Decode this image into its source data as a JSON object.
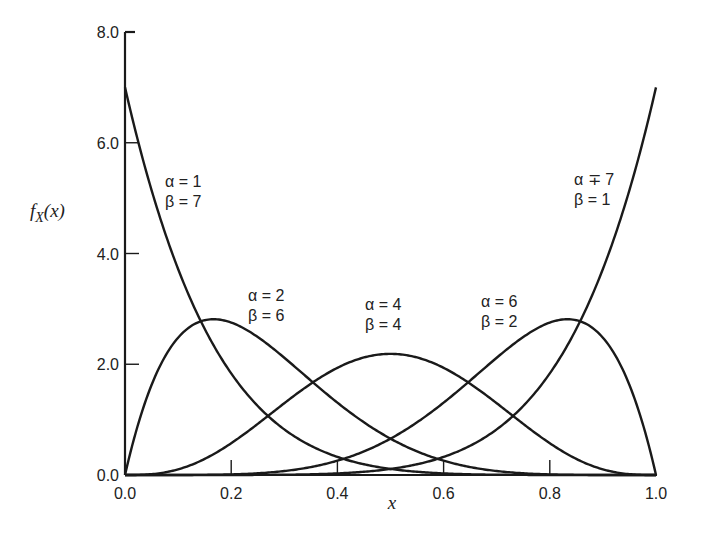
{
  "chart_data": {
    "type": "line",
    "title": "",
    "xlabel": "x",
    "ylabel": "f_X(x)",
    "ylabel_display": {
      "main": "f",
      "sub": "X",
      "arg": "(x)"
    },
    "xlim": [
      0.0,
      1.0
    ],
    "ylim": [
      0.0,
      8.0
    ],
    "x_ticks": [
      "0.0",
      "0.2",
      "0.4",
      "0.6",
      "0.8",
      "1.0"
    ],
    "x_tick_values": [
      0.0,
      0.2,
      0.4,
      0.6,
      0.8,
      1.0
    ],
    "y_ticks": [
      "0.0",
      "2.0",
      "4.0",
      "6.0",
      "8.0"
    ],
    "y_tick_values": [
      0.0,
      2.0,
      4.0,
      6.0,
      8.0
    ],
    "grid": false,
    "legend": "none (curves labeled directly)",
    "series": [
      {
        "name": "α = 1, β = 7",
        "alpha": 1,
        "beta": 7,
        "label_lines": [
          "α = 1",
          "β = 7"
        ],
        "label_pos": [
          165,
          187
        ],
        "x": [
          0.0,
          0.1,
          0.2,
          0.3,
          0.4,
          0.5,
          0.6,
          0.7,
          0.8,
          0.9,
          1.0
        ],
        "y": [
          7.0,
          3.72,
          1.83,
          0.82,
          0.33,
          0.11,
          0.03,
          0.005,
          0.0004,
          0.0,
          0.0
        ]
      },
      {
        "name": "α = 2, β = 6",
        "alpha": 2,
        "beta": 6,
        "label_lines": [
          "α = 2",
          "β = 6"
        ],
        "label_pos": [
          248,
          301
        ],
        "x": [
          0.0,
          0.1,
          0.167,
          0.2,
          0.3,
          0.4,
          0.5,
          0.6,
          0.7,
          0.8,
          0.9,
          1.0
        ],
        "y": [
          0.0,
          2.48,
          2.79,
          2.75,
          2.08,
          1.31,
          0.66,
          0.24,
          0.05,
          0.005,
          0.0,
          0.0
        ]
      },
      {
        "name": "α = 4, β = 4",
        "alpha": 4,
        "beta": 4,
        "label_lines": [
          "α = 4",
          "β = 4"
        ],
        "label_pos": [
          365,
          310
        ],
        "x": [
          0.0,
          0.1,
          0.2,
          0.3,
          0.4,
          0.5,
          0.6,
          0.7,
          0.8,
          0.9,
          1.0
        ],
        "y": [
          0.0,
          0.1,
          0.57,
          1.3,
          1.94,
          2.19,
          1.94,
          1.3,
          0.57,
          0.1,
          0.0
        ]
      },
      {
        "name": "α = 6, β = 2",
        "alpha": 6,
        "beta": 2,
        "label_lines": [
          "α = 6",
          "β = 2"
        ],
        "label_pos": [
          481,
          307
        ],
        "x": [
          0.0,
          0.1,
          0.2,
          0.3,
          0.4,
          0.5,
          0.6,
          0.7,
          0.8,
          0.833,
          0.9,
          1.0
        ],
        "y": [
          0.0,
          0.0,
          0.005,
          0.05,
          0.24,
          0.66,
          1.31,
          2.08,
          2.75,
          2.79,
          2.48,
          0.0
        ]
      },
      {
        "name": "α = 7, β = 1",
        "alpha": 7,
        "beta": 1,
        "label_lines": [
          "α ∓ 7",
          "β = 1"
        ],
        "label_pos": [
          574,
          185
        ],
        "x": [
          0.0,
          0.1,
          0.2,
          0.3,
          0.4,
          0.5,
          0.6,
          0.7,
          0.8,
          0.9,
          1.0
        ],
        "y": [
          0.0,
          0.0,
          0.0004,
          0.005,
          0.03,
          0.11,
          0.33,
          0.82,
          1.83,
          3.72,
          7.0
        ]
      }
    ]
  }
}
